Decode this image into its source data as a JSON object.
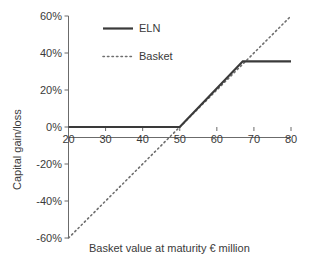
{
  "chart_data": {
    "type": "line",
    "title": "",
    "xlabel": "Basket value at maturity € million",
    "ylabel": "Capital gain/loss",
    "xlim": [
      20,
      80
    ],
    "ylim": [
      -0.6,
      0.6
    ],
    "grid": false,
    "legend_position": "top-center",
    "xticks": [
      20,
      30,
      40,
      50,
      60,
      70,
      80
    ],
    "xtick_labels": [
      "20",
      "30",
      "40",
      "50",
      "60",
      "70",
      "80"
    ],
    "yticks": [
      0.6,
      0.4,
      0.2,
      0.0,
      -0.2,
      -0.4,
      -0.6
    ],
    "ytick_labels": [
      "60%",
      "40%",
      "20%",
      "0%",
      "-20%",
      "-40%",
      "-60%"
    ],
    "series": [
      {
        "name": "ELN",
        "style": "solid",
        "color": "#3a3a3a",
        "x": [
          20,
          50,
          67,
          80
        ],
        "values": [
          0.0,
          0.0,
          0.355,
          0.355
        ]
      },
      {
        "name": "Basket",
        "style": "dotted",
        "color": "#6e6e6e",
        "x": [
          20,
          80
        ],
        "values": [
          -0.6,
          0.6
        ]
      }
    ]
  },
  "legend": {
    "entries": [
      {
        "label": "ELN"
      },
      {
        "label": "Basket"
      }
    ]
  },
  "axes": {
    "x_title": "Basket value at maturity € million",
    "y_title": "Capital gain/loss"
  }
}
